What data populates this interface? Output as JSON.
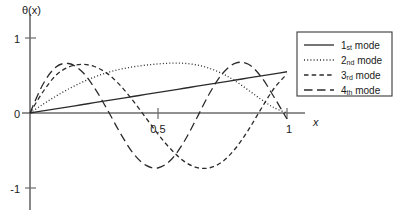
{
  "chart_data": {
    "type": "line",
    "title": "",
    "subtitle": "",
    "xlabel": "x",
    "ylabel": "θ(x)",
    "xlim": [
      0,
      1.08
    ],
    "ylim": [
      -1.25,
      1.25
    ],
    "grid": false,
    "legend_position": "top-right",
    "x_ticks": [
      {
        "value": 0.5,
        "label": "0.5"
      },
      {
        "value": 1.0,
        "label": "1"
      }
    ],
    "y_ticks": [
      {
        "value": 1,
        "label": "1"
      },
      {
        "value": 0,
        "label": "0"
      },
      {
        "value": -1,
        "label": "-1"
      }
    ],
    "x": [
      0,
      0.05,
      0.1,
      0.15,
      0.2,
      0.25,
      0.3,
      0.35,
      0.4,
      0.45,
      0.5,
      0.55,
      0.6,
      0.65,
      0.7,
      0.75,
      0.8,
      0.85,
      0.9,
      0.95,
      1.0
    ],
    "series": [
      {
        "name": "1st mode",
        "style": "solid",
        "values": [
          0,
          0.027,
          0.055,
          0.082,
          0.11,
          0.137,
          0.165,
          0.192,
          0.22,
          0.247,
          0.275,
          0.302,
          0.33,
          0.357,
          0.385,
          0.412,
          0.44,
          0.467,
          0.495,
          0.522,
          0.55
        ]
      },
      {
        "name": "2nd mode",
        "style": "dotted",
        "values": [
          0,
          0.115,
          0.223,
          0.32,
          0.406,
          0.479,
          0.538,
          0.583,
          0.615,
          0.638,
          0.655,
          0.665,
          0.662,
          0.64,
          0.594,
          0.522,
          0.424,
          0.304,
          0.18,
          0.07,
          0.0
        ]
      },
      {
        "name": "3rd mode",
        "style": "dashed-short",
        "values": [
          0,
          0.28,
          0.5,
          0.612,
          0.648,
          0.62,
          0.528,
          0.372,
          0.168,
          -0.06,
          -0.29,
          -0.49,
          -0.645,
          -0.728,
          -0.73,
          -0.645,
          -0.47,
          -0.225,
          0.06,
          0.33,
          0.52
        ]
      },
      {
        "name": "4th mode",
        "style": "dashed-long",
        "values": [
          0,
          0.38,
          0.61,
          0.66,
          0.56,
          0.34,
          0.05,
          -0.26,
          -0.53,
          -0.695,
          -0.73,
          -0.62,
          -0.38,
          -0.06,
          0.27,
          0.53,
          0.665,
          0.65,
          0.48,
          0.21,
          -0.08
        ]
      }
    ]
  },
  "legend": {
    "items": [
      {
        "ordinal": "1",
        "suffix": "st",
        "label": "mode",
        "style": "solid"
      },
      {
        "ordinal": "2",
        "suffix": "nd",
        "label": "mode",
        "style": "dotted"
      },
      {
        "ordinal": "3",
        "suffix": "rd",
        "label": "mode",
        "style": "dashed-short"
      },
      {
        "ordinal": "4",
        "suffix": "th",
        "label": "mode",
        "style": "dashed-long"
      }
    ]
  }
}
